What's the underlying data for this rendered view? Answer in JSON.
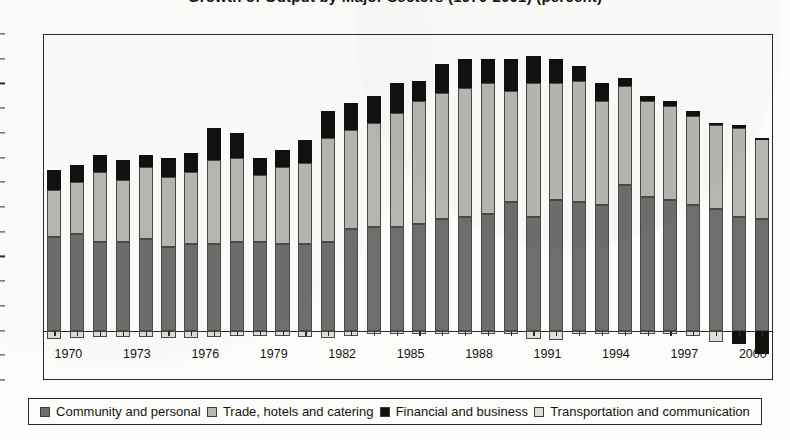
{
  "title": "Growth of Output by Major Sectors (1970-2001) (percent)",
  "legend": {
    "position": "bottom",
    "items": [
      {
        "label": "Community and personal",
        "color": "#6e6e6c",
        "swatch": "filled-square-dark-gray"
      },
      {
        "label": "Trade, hotels and catering",
        "color": "#b6b6b2",
        "swatch": "filled-square-medium-gray"
      },
      {
        "label": "Financial and business",
        "color": "#111110",
        "swatch": "filled-square-black"
      },
      {
        "label": "Transportation and communication",
        "color": "#dcdcd8",
        "swatch": "filled-square-light-gray"
      }
    ]
  },
  "chart_data": {
    "type": "bar",
    "stacked": true,
    "title": "Growth of Output by Major Sectors (1970-2001) (percent)",
    "xlabel": "",
    "ylabel": "",
    "ylim": [
      -2,
      12
    ],
    "ytick_step": 1,
    "yticks": [
      12,
      11,
      10,
      9,
      8,
      7,
      6,
      5,
      4,
      3,
      2,
      1,
      0,
      -1,
      -2
    ],
    "ytick_labels": [
      "12",
      "11",
      "10",
      "9",
      "8",
      "7",
      "6",
      "5",
      "4",
      "3",
      "2",
      "1",
      "0",
      "-1",
      "-2"
    ],
    "grid": false,
    "xtick_labels": [
      "1970",
      "1973",
      "1976",
      "1979",
      "1982",
      "1985",
      "1988",
      "1991",
      "1994",
      "1997",
      "2000"
    ],
    "categories": [
      "1970",
      "1971",
      "1972",
      "1973",
      "1974",
      "1975",
      "1976",
      "1977",
      "1978",
      "1979",
      "1980",
      "1981",
      "1982",
      "1983",
      "1984",
      "1985",
      "1986",
      "1987",
      "1988",
      "1989",
      "1990",
      "1991",
      "1992",
      "1993",
      "1994",
      "1995",
      "1996",
      "1997",
      "1998",
      "1999",
      "2000",
      "2001"
    ],
    "series": [
      {
        "name": "Community and personal",
        "color": "#6e6e6c",
        "values": [
          3.8,
          3.9,
          3.6,
          3.6,
          3.7,
          3.4,
          3.5,
          3.5,
          3.6,
          3.6,
          3.5,
          3.5,
          3.6,
          4.1,
          4.2,
          4.2,
          4.3,
          4.5,
          4.6,
          4.7,
          5.2,
          4.6,
          5.3,
          5.2,
          5.1,
          5.9,
          5.4,
          5.3,
          5.1,
          4.9,
          4.6,
          4.5
        ]
      },
      {
        "name": "Trade, hotels and catering",
        "color": "#b6b6b2",
        "values": [
          1.9,
          2.1,
          2.8,
          2.5,
          2.9,
          2.8,
          2.9,
          3.4,
          3.4,
          2.7,
          3.1,
          3.3,
          4.2,
          4.0,
          4.2,
          4.6,
          5.0,
          5.1,
          5.2,
          5.3,
          4.5,
          5.4,
          4.7,
          4.9,
          4.2,
          4.0,
          3.9,
          3.8,
          3.6,
          3.4,
          3.6,
          3.3
        ]
      },
      {
        "name": "Financial and business",
        "color": "#111110",
        "values": [
          0.8,
          0.7,
          0.7,
          0.8,
          0.5,
          0.8,
          0.8,
          1.3,
          1.0,
          0.7,
          0.7,
          0.9,
          1.1,
          1.1,
          1.1,
          1.2,
          0.8,
          1.2,
          1.2,
          1.0,
          1.3,
          1.1,
          1.0,
          0.6,
          0.7,
          0.3,
          0.2,
          0.2,
          0.2,
          0.1,
          0.1,
          0.0
        ]
      },
      {
        "name": "Transportation and communication",
        "color": "#dcdcd8",
        "values": [
          -0.35,
          -0.3,
          -0.25,
          -0.25,
          -0.25,
          -0.3,
          -0.3,
          -0.25,
          -0.2,
          -0.2,
          -0.2,
          -0.25,
          -0.3,
          -0.2,
          -0.15,
          -0.15,
          -0.15,
          -0.15,
          -0.15,
          -0.15,
          -0.15,
          -0.35,
          -0.4,
          -0.15,
          -0.15,
          -0.15,
          -0.15,
          -0.15,
          -0.2,
          -0.45,
          -0.55,
          -0.95
        ]
      }
    ]
  }
}
